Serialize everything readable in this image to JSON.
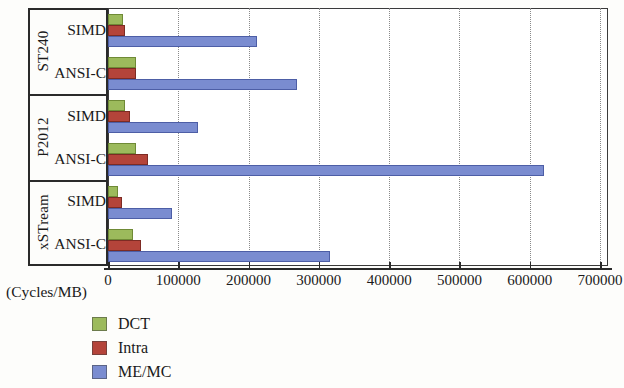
{
  "chart_data": {
    "type": "bar",
    "orientation": "horizontal",
    "title": "",
    "xlabel": "(Cycles/MB)",
    "ylabel": "",
    "xlim": [
      0,
      700000
    ],
    "xticks": [
      0,
      100000,
      200000,
      300000,
      400000,
      500000,
      600000,
      700000
    ],
    "xtick_labels": [
      "0",
      "100000",
      "200000",
      "300000",
      "400000",
      "500000",
      "600000",
      "700000"
    ],
    "grid": "vertical-dotted",
    "legend_position": "below-left",
    "groups": [
      {
        "name": "ST240",
        "rows": [
          {
            "label": "SIMD",
            "DCT": 21000,
            "Intra": 24000,
            "ME/MC": 212000
          },
          {
            "label": "ANSI-C",
            "DCT": 40000,
            "Intra": 40000,
            "ME/MC": 269000
          }
        ]
      },
      {
        "name": "P2012",
        "rows": [
          {
            "label": "SIMD",
            "DCT": 24000,
            "Intra": 31000,
            "ME/MC": 128000
          },
          {
            "label": "ANSI-C",
            "DCT": 40000,
            "Intra": 57000,
            "ME/MC": 620000
          }
        ]
      },
      {
        "name": "xSTream",
        "rows": [
          {
            "label": "SIMD",
            "DCT": 14000,
            "Intra": 20000,
            "ME/MC": 91000
          },
          {
            "label": "ANSI-C",
            "DCT": 36000,
            "Intra": 47000,
            "ME/MC": 316000
          }
        ]
      }
    ],
    "series": [
      {
        "name": "DCT",
        "color": "#9cba5c",
        "values": [
          21000,
          40000,
          24000,
          40000,
          14000,
          36000
        ]
      },
      {
        "name": "Intra",
        "color": "#b4443a",
        "values": [
          24000,
          40000,
          31000,
          57000,
          20000,
          47000
        ]
      },
      {
        "name": "ME/MC",
        "color": "#7a8cd0",
        "values": [
          212000,
          269000,
          128000,
          620000,
          91000,
          316000
        ]
      }
    ],
    "categories": [
      "ST240 / SIMD",
      "ST240 / ANSI-C",
      "P2012 / SIMD",
      "P2012 / ANSI-C",
      "xSTream / SIMD",
      "xSTream / ANSI-C"
    ]
  },
  "legend": {
    "items": [
      {
        "label": "DCT",
        "color": "#9cba5c"
      },
      {
        "label": "Intra",
        "color": "#b4443a"
      },
      {
        "label": "ME/MC",
        "color": "#7a8cd0"
      }
    ]
  },
  "axis": {
    "unit_label": "(Cycles/MB)"
  }
}
